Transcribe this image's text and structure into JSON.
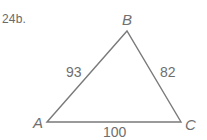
{
  "problem": {
    "number": "24b."
  },
  "triangle": {
    "vertices": {
      "A": {
        "label": "A",
        "x": 47,
        "y": 122
      },
      "B": {
        "label": "B",
        "x": 127,
        "y": 31
      },
      "C": {
        "label": "C",
        "x": 181,
        "y": 122
      }
    },
    "sides": {
      "AB": {
        "label": "93"
      },
      "BC": {
        "label": "82"
      },
      "AC": {
        "label": "100"
      }
    },
    "stroke_color": "#7a7a7a"
  }
}
